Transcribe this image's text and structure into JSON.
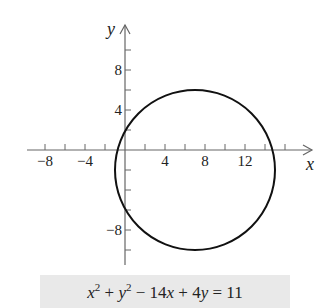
{
  "chart_data": {
    "type": "line",
    "title": "",
    "equation": "x² + y² − 14x + 4y = 11",
    "shape": "circle",
    "center": [
      7,
      -2
    ],
    "radius": 8,
    "xlabel": "x",
    "ylabel": "y",
    "xlim": [
      -10,
      18
    ],
    "ylim": [
      -11,
      12.5
    ],
    "x_tick_step": 2,
    "y_tick_step": 2,
    "x_tick_labels": [
      {
        "value": -8,
        "label": "−8"
      },
      {
        "value": -4,
        "label": "−4"
      },
      {
        "value": 4,
        "label": "4"
      },
      {
        "value": 8,
        "label": "8"
      },
      {
        "value": 12,
        "label": "12"
      }
    ],
    "y_tick_labels": [
      {
        "value": 8,
        "label": "8"
      },
      {
        "value": 4,
        "label": "4"
      },
      {
        "value": -8,
        "label": "−8"
      }
    ],
    "grid": false,
    "legend": null
  },
  "equation_box": {
    "parts": [
      "x",
      "2",
      " + ",
      "y",
      "2",
      " − 14",
      "x",
      " + 4",
      "y",
      " = 11"
    ],
    "background": "#e9e9e9"
  },
  "colors": {
    "axis": "#666666",
    "curve": "#111111",
    "text": "#222222"
  },
  "layout": {
    "origin_px": [
      125,
      150
    ],
    "px_per_unit": 10
  }
}
